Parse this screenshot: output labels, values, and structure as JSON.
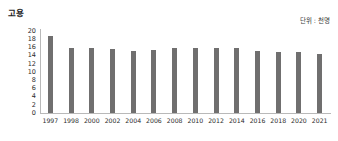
{
  "chart_data": {
    "type": "bar",
    "title": "고용",
    "unit_label": "단위 : 천명",
    "xlabel": "",
    "ylabel": "",
    "ylim": [
      0,
      20
    ],
    "y_ticks": [
      0,
      2,
      4,
      6,
      8,
      10,
      12,
      14,
      16,
      18,
      20
    ],
    "grid": false,
    "legend": "none",
    "bar_color": "#706f6f",
    "axis_color": "#b9b9b9",
    "categories": [
      "1997",
      "1998",
      "2000",
      "2002",
      "2004",
      "2006",
      "2008",
      "2010",
      "2012",
      "2014",
      "2016",
      "2018",
      "2020",
      "2021"
    ],
    "values": [
      18.7,
      15.8,
      15.9,
      15.6,
      15.1,
      15.4,
      15.8,
      15.9,
      15.9,
      15.9,
      15.1,
      14.8,
      14.9,
      14.3
    ]
  }
}
